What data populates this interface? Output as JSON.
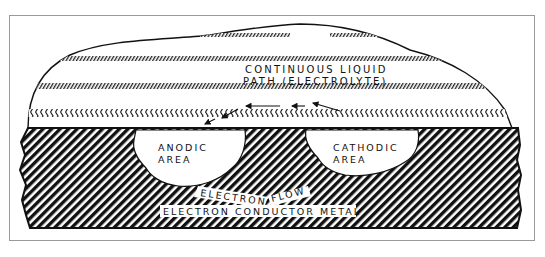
{
  "figure": {
    "labels": {
      "electrolyte_line1": "CONTINUOUS LIQUID",
      "electrolyte_line2": "PATH (ELECTROLYTE)",
      "anodic_line1": "ANODIC",
      "anodic_line2": "AREA",
      "cathodic_line1": "CATHODIC",
      "cathodic_line2": "AREA",
      "electron_flow_1": "ELECTRON",
      "electron_flow_2": "FLOW",
      "metal": "ELECTRON CONDUCTOR METAL"
    },
    "regions": [
      {
        "name": "electrolyte",
        "fill": "white with hatched bands"
      },
      {
        "name": "metal",
        "fill": "diagonal black hatching"
      },
      {
        "name": "anodic-area",
        "fill": "white pit"
      },
      {
        "name": "cathodic-area",
        "fill": "white pit"
      }
    ],
    "arrows": {
      "ion_flow_direction": "right-to-left (cathodic to anodic)",
      "electron_flow_direction": "left-to-right (anodic to cathodic)"
    },
    "colors": {
      "ink": "#111111",
      "paper": "#ffffff",
      "frame": "#9a9a9a"
    }
  }
}
